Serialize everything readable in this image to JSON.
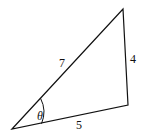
{
  "diagram": {
    "type": "triangle",
    "vertices": {
      "A": [
        12,
        129
      ],
      "B": [
        123,
        9
      ],
      "C": [
        128,
        105
      ]
    },
    "sides": {
      "AB": "7",
      "BC": "4",
      "AC": "5"
    },
    "angle_label": "θ",
    "line_color": "#111111"
  }
}
